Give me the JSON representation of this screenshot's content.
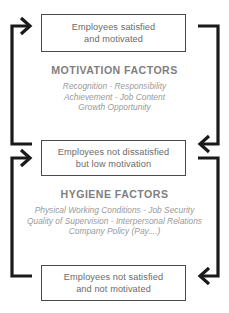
{
  "diagram": {
    "colors": {
      "box_border": "#4a4a4a",
      "box_text": "#6b6b6b",
      "section_title": "#808080",
      "section_item": "#9a9a9a",
      "arrow": "#1a1a1a",
      "background": "#ffffff"
    },
    "boxes": [
      {
        "id": "top",
        "lines": [
          "Employees satisfied",
          "and motivated"
        ]
      },
      {
        "id": "middle",
        "lines": [
          "Employees not dissatisfied",
          "but low motivation"
        ]
      },
      {
        "id": "bottom",
        "lines": [
          "Employees not satisfied",
          "and not motivated"
        ]
      }
    ],
    "sections": [
      {
        "id": "motivation",
        "title": "MOTIVATION FACTORS",
        "items": [
          "Recognition - Responsibility",
          "Achievement - Job Content",
          "Growth Opportunity"
        ]
      },
      {
        "id": "hygiene",
        "title": "HYGIENE FACTORS",
        "items": [
          "Physical Working Conditions - Job Security",
          "Quality of Supervision - Interpersonal Relations",
          "Company Policy (Pay....)"
        ]
      }
    ],
    "arrows": [
      {
        "id": "left-motivation",
        "icon": "bracket-arrow-up-right",
        "direction": "right"
      },
      {
        "id": "right-motivation",
        "icon": "bracket-arrow-down-left",
        "direction": "left"
      },
      {
        "id": "left-hygiene",
        "icon": "bracket-arrow-up-right",
        "direction": "right"
      },
      {
        "id": "right-hygiene",
        "icon": "bracket-arrow-down-left",
        "direction": "left"
      }
    ]
  }
}
